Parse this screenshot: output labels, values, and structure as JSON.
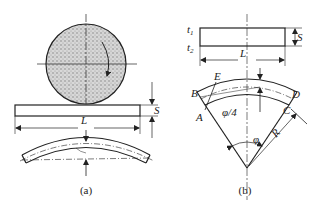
{
  "figure": {
    "panel_a": {
      "caption": "(a)",
      "labels": {
        "length": "L",
        "thickness": "S"
      },
      "elements": [
        "roller-circle-with-rotation-arrow",
        "flat-strip",
        "bent-strip"
      ]
    },
    "panel_b": {
      "caption": "(b)",
      "labels": {
        "top_surface": "t",
        "top_surface_sub": "1",
        "bottom_surface": "t",
        "bottom_surface_sub": "2",
        "thickness": "S",
        "length": "L",
        "point_b": "B",
        "point_e": "E",
        "point_d": "D",
        "point_a": "A",
        "point_c": "C",
        "quarter_angle": "φ/4",
        "angle": "φ",
        "radius": "R"
      }
    },
    "colors": {
      "stroke": "#222222",
      "fill_pattern": "#9a9a9a",
      "background": "#ffffff"
    }
  }
}
